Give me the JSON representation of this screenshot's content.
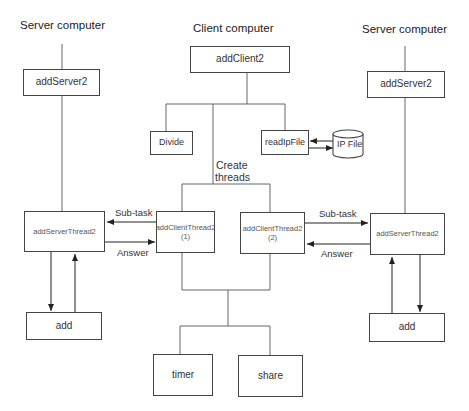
{
  "diagram": {
    "type": "architecture",
    "columns": {
      "left_server": {
        "title": "Server computer"
      },
      "client": {
        "title": "Client computer"
      },
      "right_server": {
        "title": "Server computer"
      }
    },
    "nodes": {
      "addServer2_left": "addServer2",
      "addClient2": "addClient2",
      "addServer2_right": "addServer2",
      "divide": "Divide",
      "readIpFile": "readIpFile",
      "ip_file": "IP File",
      "addServerThread2_left": "addServerThread2",
      "addClientThread2_1": {
        "name": "addClientThread2",
        "index": "(1)"
      },
      "addClientThread2_2": {
        "name": "addClientThread2",
        "index": "(2)"
      },
      "addServerThread2_right": "addServerThread2",
      "add_left": "add",
      "add_right": "add",
      "timer": "timer",
      "share": "share"
    },
    "edge_labels": {
      "create_threads_line1": "Create",
      "create_threads_line2": "threads",
      "subtask_left": "Sub-task",
      "answer_left": "Answer",
      "subtask_right": "Sub-task",
      "answer_right": "Answer"
    },
    "colors": {
      "line": "#555555",
      "box_border": "#444444",
      "text": "#333333"
    }
  }
}
